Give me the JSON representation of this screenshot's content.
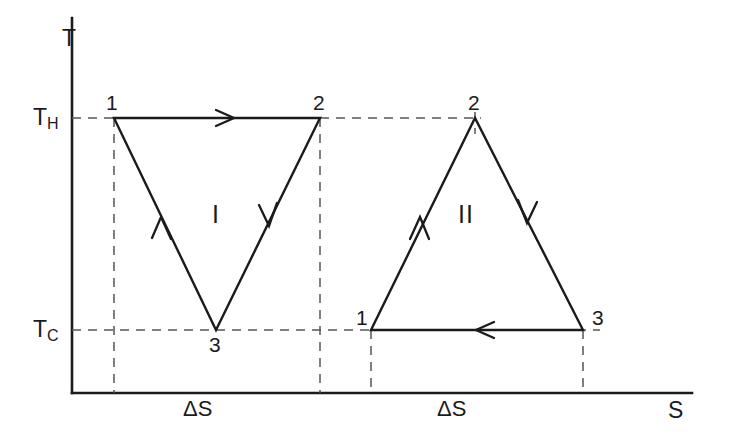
{
  "figure": {
    "type": "thermodynamic-cycle-diagram",
    "background_color": "#ffffff",
    "line_color": "#1b1b1b",
    "guide_color": "#555555"
  },
  "axes": {
    "y_label": "T",
    "x_label": "S",
    "y_axis_x": 72,
    "x_axis_y": 393,
    "y_axis_top": 18,
    "x_axis_right": 692
  },
  "temperature_levels": [
    {
      "key": "hot",
      "symbol": "T",
      "subscript": "H",
      "y": 118
    },
    {
      "key": "cold",
      "symbol": "T",
      "subscript": "C",
      "y": 330
    }
  ],
  "entropy_labels": [
    {
      "text": "ΔS",
      "x": 196,
      "y": 404
    },
    {
      "text": "ΔS",
      "x": 450,
      "y": 404
    }
  ],
  "cycles": [
    {
      "name": "I",
      "label": "I",
      "label_x": 212,
      "label_y": 202,
      "orientation": "inverted-triangle",
      "vertices": [
        {
          "id": "1",
          "x": 114,
          "y": 118,
          "label_x": 106,
          "label_y": 92
        },
        {
          "id": "2",
          "x": 320,
          "y": 118,
          "label_x": 313,
          "label_y": 92
        },
        {
          "id": "3",
          "x": 216,
          "y": 330,
          "label_x": 209,
          "label_y": 334
        }
      ],
      "edges": [
        {
          "from": "1",
          "to": "2",
          "direction": "right",
          "arrow_t": 0.54
        },
        {
          "from": "2",
          "to": "3",
          "direction": "down-left",
          "arrow_t": 0.46
        },
        {
          "from": "3",
          "to": "1",
          "direction": "up-left",
          "arrow_t": 0.53
        }
      ]
    },
    {
      "name": "II",
      "label": "II",
      "label_x": 461,
      "label_y": 202,
      "orientation": "upright-triangle",
      "vertices": [
        {
          "id": "1",
          "x": 371,
          "y": 330,
          "label_x": 358,
          "label_y": 307
        },
        {
          "id": "2",
          "x": 475,
          "y": 118,
          "label_x": 468,
          "label_y": 92
        },
        {
          "id": "3",
          "x": 583,
          "y": 330,
          "label_x": 592,
          "label_y": 307
        }
      ],
      "edges": [
        {
          "from": "1",
          "to": "2",
          "direction": "up-right",
          "arrow_t": 0.46
        },
        {
          "from": "2",
          "to": "3",
          "direction": "down-right",
          "arrow_t": 0.45
        },
        {
          "from": "3",
          "to": "1",
          "direction": "left",
          "arrow_t": 0.55
        }
      ]
    }
  ],
  "guides": {
    "horizontal": [
      {
        "level": "hot",
        "y": 118,
        "x1": 72,
        "x2": 114
      },
      {
        "level": "hot",
        "y": 118,
        "x1": 320,
        "x2": 481
      },
      {
        "level": "cold",
        "y": 330,
        "x1": 72,
        "x2": 378
      },
      {
        "level": "cold",
        "y": 330,
        "x1": 577,
        "x2": 600
      }
    ],
    "vertical": [
      {
        "x": 114,
        "y1": 118,
        "y2": 393
      },
      {
        "x": 320,
        "y1": 118,
        "y2": 393
      },
      {
        "x": 371,
        "y1": 330,
        "y2": 393
      },
      {
        "x": 583,
        "y1": 330,
        "y2": 393
      },
      {
        "x": 475,
        "y1": 118,
        "y2": 132
      }
    ]
  }
}
